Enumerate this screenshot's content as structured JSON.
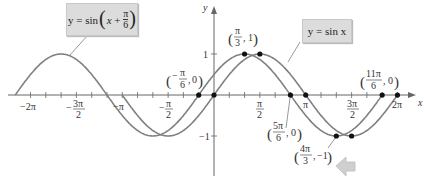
{
  "chart_data": {
    "type": "line",
    "title": "",
    "xlabel": "x",
    "ylabel": "y",
    "xlim": [
      -6.45,
      6.6
    ],
    "ylim": [
      -1.6,
      2.3
    ],
    "grid": false,
    "x_ticks_step": "π/6",
    "x_tick_labels": [
      "-2π",
      "-3π/2",
      "-π",
      "-π/2",
      "π/2",
      "π",
      "3π/2",
      "2π"
    ],
    "y_tick_labels": [
      "1",
      "-1"
    ],
    "series": [
      {
        "name": "y = sin x",
        "function": "sin(x)",
        "color": "#808080"
      },
      {
        "name": "y = sin(x + π/6)",
        "function": "sin(x + pi/6)",
        "color": "#808080"
      }
    ],
    "highlighted_points": [
      {
        "label": "(-π/6, 0)",
        "x": -0.5236,
        "y": 0
      },
      {
        "label": "(0, 0)",
        "x": 0,
        "y": 0
      },
      {
        "label": "(π/3, 1)",
        "x": 1.0472,
        "y": 1
      },
      {
        "label": "(π/2, 1)",
        "x": 1.5708,
        "y": 1
      },
      {
        "label": "(5π/6, 0)",
        "x": 2.618,
        "y": 0
      },
      {
        "label": "(π, 0)",
        "x": 3.1416,
        "y": 0
      },
      {
        "label": "(4π/3, -1)",
        "x": 4.1888,
        "y": -1
      },
      {
        "label": "(3π/2, -1)",
        "x": 4.7124,
        "y": -1
      },
      {
        "label": "(11π/6, 0)",
        "x": 5.7596,
        "y": 0
      },
      {
        "label": "(2π, 0)",
        "x": 6.2832,
        "y": 0
      }
    ],
    "annotations": [
      "y = sin(x + π/6)",
      "y = sin x",
      "(-π/6, 0)",
      "(π/3, 1)",
      "(5π/6, 0)",
      "(4π/3, -1)",
      "(11π/6, 0)"
    ],
    "legend": "callout boxes"
  },
  "labels": {
    "box_shifted": "y = sin(x + π/6)",
    "box_shifted_prefix": "y = sin",
    "box_sin": "y = sin x",
    "axis_x": "x",
    "axis_y": "y",
    "tick_neg2pi": "−2π",
    "tick_neg3pi2_num": "3π",
    "tick_neg3pi2_den": "2",
    "tick_negpi": "−π",
    "tick_negpi2_num": "π",
    "tick_negpi2_den": "2",
    "tick_pi2_num": "π",
    "tick_pi2_den": "2",
    "tick_pi": "π",
    "tick_3pi2_num": "3π",
    "tick_3pi2_den": "2",
    "tick_2pi": "2π",
    "tick_y1": "1",
    "tick_yneg1": "−1",
    "pt_neg_pi6_num": "π",
    "pt_neg_pi6_den": "6",
    "pt_pi3_num": "π",
    "pt_pi3_den": "3",
    "pt_5pi6_num": "5π",
    "pt_5pi6_den": "6",
    "pt_4pi3_num": "4π",
    "pt_4pi3_den": "3",
    "pt_11pi6_num": "11π",
    "pt_11pi6_den": "6",
    "zero": "0",
    "one": "1",
    "neg_one": "−1"
  },
  "colors": {
    "curve": "#808080",
    "axis": "#555555",
    "dot": "#111111",
    "box": "#dcdcdc",
    "arrow": "#c8c8c8"
  }
}
